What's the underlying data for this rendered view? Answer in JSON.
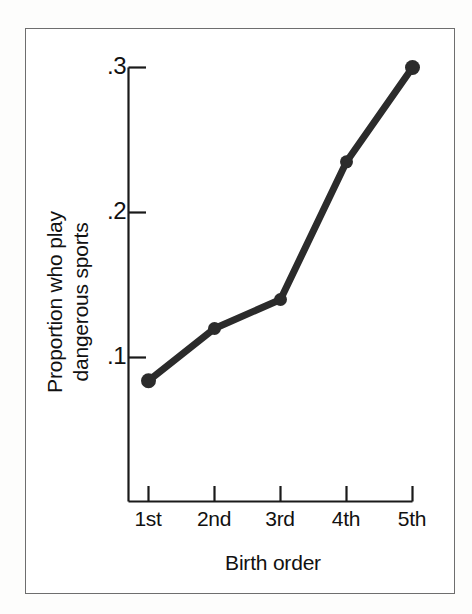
{
  "chart_data": {
    "type": "line",
    "title": "",
    "subtitle": "",
    "xlabel": "Birth order",
    "ylabel": "Proportion who play\ndangerous sports",
    "ylabel_line1": "Proportion who play",
    "ylabel_line2": "dangerous sports",
    "categories": [
      "1st",
      "2nd",
      "3rd",
      "4th",
      "5th"
    ],
    "values": [
      0.084,
      0.12,
      0.14,
      0.235,
      0.3
    ],
    "series": [
      {
        "name": "Proportion who play dangerous sports",
        "values": [
          0.084,
          0.12,
          0.14,
          0.235,
          0.3
        ]
      }
    ],
    "ytick_labels": [
      ".3",
      ".2",
      ".1"
    ],
    "ytick_values": [
      0.3,
      0.2,
      0.1
    ],
    "xtick_labels": [
      "1st",
      "2nd",
      "3rd",
      "4th",
      "5th"
    ],
    "ylim": [
      0.0,
      0.3
    ],
    "xlim": [
      0,
      6
    ],
    "grid": false,
    "legend": false,
    "legend_position": "none",
    "line_color": "#2b2b2b",
    "marker": "circle",
    "marker_color": "#2b2b2b",
    "axis_color": "#1a1a1a",
    "frame_color": "#6e6e6e",
    "background_color": "#ffffff"
  },
  "axes": {
    "y_axis_name": "y-axis",
    "x_axis_name": "x-axis"
  },
  "figure": {
    "frame_label": "figure-border"
  }
}
